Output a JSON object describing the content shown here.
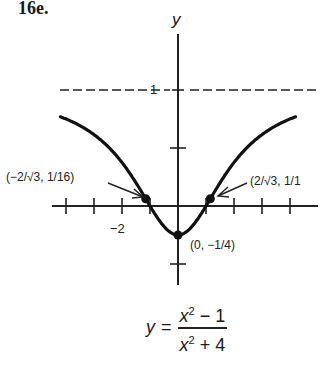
{
  "problem": {
    "number": "16e."
  },
  "axes": {
    "y_label": "y",
    "x_tick_label": "−2",
    "asymptote_label": "1"
  },
  "annotations": {
    "left_inflection": "(−2/√3, 1/16)",
    "right_inflection": "(2/√3, 1/1",
    "minimum": "(0, −1/4)"
  },
  "formula": {
    "lhs": "y",
    "eq": "=",
    "num_var": "x",
    "num_exp": "2",
    "num_rest": " − 1",
    "den_var": "x",
    "den_exp": "2",
    "den_rest": " + 4"
  },
  "chart_data": {
    "type": "line",
    "xlabel": "",
    "ylabel": "y",
    "xlim": [
      -4.2,
      4.2
    ],
    "ylim": [
      -0.7,
      1.5
    ],
    "x_ticks": [
      -4,
      -3,
      -2,
      -1,
      0,
      1,
      2,
      3,
      4
    ],
    "x_tick_labels": {
      "-2": "−2"
    },
    "y_ticks": [
      -0.5,
      0.5,
      1
    ],
    "y_tick_labels": {
      "1": "1"
    },
    "horizontal_asymptote": {
      "y": 1,
      "style": "dashed"
    },
    "grid": false,
    "series": [
      {
        "name": "y = (x^2 - 1)/(x^2 + 4)",
        "x": [
          -4.2,
          -4,
          -3,
          -2,
          -1.155,
          -1,
          0,
          1,
          1.155,
          2,
          3,
          4,
          4.2
        ],
        "values": [
          0.775,
          0.75,
          0.615,
          0.375,
          0.0625,
          0,
          -0.25,
          0,
          0.0625,
          0.375,
          0.615,
          0.75,
          0.775
        ]
      }
    ],
    "marked_points": [
      {
        "x": -1.155,
        "y": 0.0625,
        "label": "(−2/√3, 1/16)"
      },
      {
        "x": 1.155,
        "y": 0.0625,
        "label": "(2/√3, 1/16)"
      },
      {
        "x": 0,
        "y": -0.25,
        "label": "(0, −1/4)"
      }
    ]
  }
}
